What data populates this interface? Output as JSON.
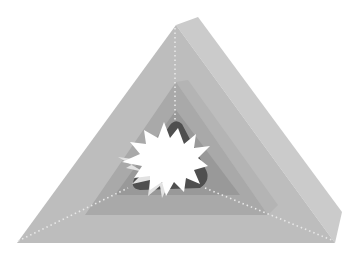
{
  "figure": {
    "type": "illustration",
    "alt_text": "Grey 3D pyramid with nested inner layers and a white starburst at the core"
  },
  "colors": {
    "background": "#ffffff",
    "outer_face": "#bdbdbd",
    "outer_side": "#cbcbcb",
    "outer_top_edge": "#d3d3d3",
    "middle_face": "#a9a9a9",
    "middle_side": "#b4b4b4",
    "inner_face": "#989898",
    "core_dark": "#4f4f4f",
    "starburst": "#ffffff",
    "starburst_shadow": "#e2e2e2",
    "dotted_edge": "#e8e8e8"
  }
}
